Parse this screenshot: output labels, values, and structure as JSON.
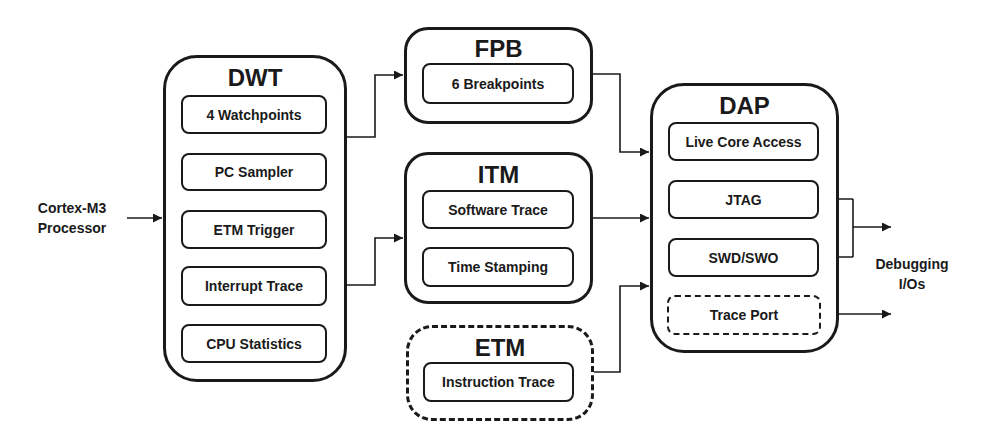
{
  "input_label": [
    "Cortex-M3",
    "Processor"
  ],
  "output_label": [
    "Debugging",
    "I/Os"
  ],
  "blocks": {
    "dwt": {
      "title": "DWT",
      "items": [
        "4 Watchpoints",
        "PC Sampler",
        "ETM Trigger",
        "Interrupt Trace",
        "CPU Statistics"
      ]
    },
    "fpb": {
      "title": "FPB",
      "items": [
        "6 Breakpoints"
      ]
    },
    "itm": {
      "title": "ITM",
      "items": [
        "Software Trace",
        "Time Stamping"
      ]
    },
    "etm": {
      "title": "ETM",
      "optional": true,
      "items": [
        "Instruction Trace"
      ]
    },
    "dap": {
      "title": "DAP",
      "items": [
        "Live Core Access",
        "JTAG",
        "SWD/SWO",
        "Trace Port"
      ],
      "optional_items": [
        "Trace Port"
      ]
    }
  },
  "connections": [
    {
      "from": "Cortex-M3 Processor",
      "to": "DWT"
    },
    {
      "from": "DWT",
      "to": "FPB"
    },
    {
      "from": "DWT",
      "to": "ITM"
    },
    {
      "from": "FPB",
      "to": "DAP"
    },
    {
      "from": "ITM",
      "to": "DAP"
    },
    {
      "from": "ETM",
      "to": "DAP"
    },
    {
      "from": "Debugging I/Os",
      "to": "JTAG",
      "bidirectional": true
    },
    {
      "from": "Debugging I/Os",
      "to": "SWD/SWO",
      "bidirectional": true
    },
    {
      "from": "Trace Port",
      "to": "Debugging I/Os"
    }
  ],
  "colors": {
    "stroke": "#1a1a1a",
    "background": "#ffffff"
  }
}
